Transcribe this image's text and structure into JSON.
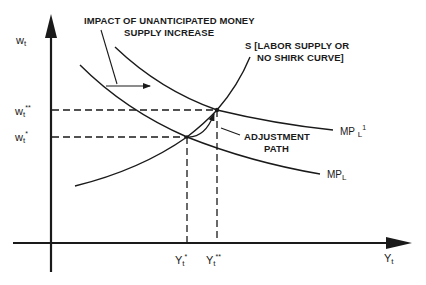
{
  "diagram": {
    "type": "economic-graph",
    "axes": {
      "y_axis": {
        "label_main": "w",
        "label_sub": "t"
      },
      "x_axis": {
        "label_main": "Y",
        "label_sub": "t"
      }
    },
    "y_ticks": [
      {
        "main": "w",
        "sub": "t",
        "sup": "**"
      },
      {
        "main": "w",
        "sub": "t",
        "sup": "*"
      }
    ],
    "x_ticks": [
      {
        "main": "Y",
        "sub": "t",
        "sup": "*"
      },
      {
        "main": "Y",
        "sub": "t",
        "sup": "**"
      }
    ],
    "annotations": {
      "impact_line1": "IMPACT OF UNANTICIPATED MONEY",
      "impact_line2": "SUPPLY INCREASE",
      "supply_line1": "S [LABOR SUPPLY OR",
      "supply_line2": "NO SHIRK CURVE]",
      "adjustment_line1": "ADJUSTMENT",
      "adjustment_line2": "PATH"
    },
    "curves": {
      "mpl": {
        "main": "MP",
        "sub": "L"
      },
      "mpl1": {
        "main": "MP",
        "sub": "L",
        "sup": "1"
      }
    },
    "colors": {
      "ink": "#1a1a1a",
      "background": "#ffffff"
    }
  }
}
